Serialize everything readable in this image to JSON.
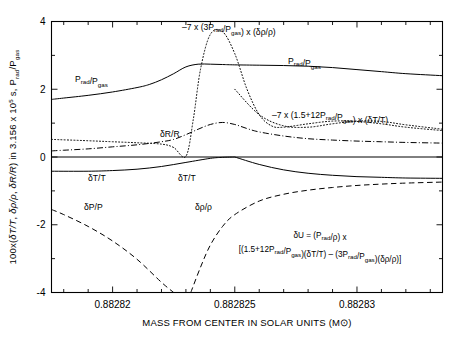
{
  "chart_data": {
    "type": "line",
    "title": "",
    "xlabel": "MASS FROM CENTER IN SOLAR UNITS (M⊙)",
    "ylabel": "100x(δT/T, δρ/ρ, δR/R) in 3.156 x 10⁵ s, P_rad/P_gas",
    "xlim": [
      0.8828175,
      0.8828335
    ],
    "ylim": [
      -4,
      4
    ],
    "grid": false,
    "legend_position": "inline-curve-labels",
    "xticks": [
      "0.88282",
      "0.882825",
      "0.88283"
    ],
    "xtick_values": [
      0.88282,
      0.882825,
      0.88283
    ],
    "yticks": [
      "4",
      "2",
      "0",
      "-2",
      "-4"
    ],
    "ytick_values": [
      4,
      2,
      0,
      -2,
      -4
    ],
    "minor_tick_step_y": 1,
    "minor_tick_step_x": 1e-06,
    "series": [
      {
        "name": "P_rad/P_gas",
        "label": "P_rad/P_gas",
        "style": "solid",
        "x": [
          0.8828175,
          0.882818,
          0.882819,
          0.88282,
          0.882821,
          0.8828215,
          0.882822,
          0.8828225,
          0.882823,
          0.8828235,
          0.882824,
          0.8828245,
          0.882825,
          0.882826,
          0.882827,
          0.882828,
          0.882829,
          0.88283,
          0.882831,
          0.882832,
          0.8828335
        ],
        "y": [
          1.7,
          1.74,
          1.82,
          1.92,
          2.05,
          2.14,
          2.28,
          2.46,
          2.66,
          2.74,
          2.74,
          2.73,
          2.72,
          2.71,
          2.7,
          2.68,
          2.64,
          2.58,
          2.52,
          2.46,
          2.4
        ]
      },
      {
        "name": "-7 x (3P_rad/P_gas) x (delta-rho/rho)",
        "label": "–7 x (3P_rad/P_gas) x (δρ/ρ)",
        "style": "dotted",
        "x": [
          0.8828175,
          0.882819,
          0.88282,
          0.882821,
          0.882822,
          0.8828225,
          0.882823,
          0.8828233,
          0.8828236,
          0.882824,
          0.8828245,
          0.882825,
          0.8828255,
          0.882826,
          0.8828265,
          0.882827,
          0.882828,
          0.882829,
          0.88283,
          0.882831,
          0.882832,
          0.8828335
        ],
        "y": [
          0.52,
          0.48,
          0.45,
          0.42,
          0.38,
          0.28,
          0.02,
          1.1,
          2.6,
          3.62,
          3.7,
          3.05,
          2.0,
          1.25,
          0.92,
          0.88,
          0.98,
          1.06,
          1.05,
          0.98,
          0.88,
          0.78
        ]
      },
      {
        "name": "-7 x (1.5+12P_rad/P_gas) x (delta-T/T)",
        "label": "–7 x (1.5+12P_rad/P_gas) x (δT/T)",
        "style": "dotted-right-branch",
        "x": [
          0.882825,
          0.882826,
          0.882827,
          0.882828,
          0.882829,
          0.88283,
          0.882831,
          0.882832,
          0.8828335
        ],
        "y": [
          2.0,
          1.25,
          0.92,
          0.88,
          0.98,
          1.06,
          1.05,
          0.95,
          0.82
        ]
      },
      {
        "name": "delta-R/R",
        "label": "δR/R",
        "style": "dash-dot",
        "x": [
          0.8828175,
          0.882818,
          0.882819,
          0.88282,
          0.882821,
          0.882822,
          0.8828225,
          0.882823,
          0.8828235,
          0.882824,
          0.8828245,
          0.882825,
          0.8828255,
          0.882826,
          0.882827,
          0.882828,
          0.882829,
          0.88283,
          0.882831,
          0.882832,
          0.8828335
        ],
        "y": [
          0.18,
          0.2,
          0.24,
          0.3,
          0.36,
          0.45,
          0.52,
          0.66,
          0.82,
          0.96,
          1.02,
          0.96,
          0.84,
          0.74,
          0.62,
          0.54,
          0.5,
          0.47,
          0.45,
          0.43,
          0.41
        ]
      },
      {
        "name": "delta-T/T-left",
        "label": "δT/T",
        "style": "solid",
        "x": [
          0.8828175,
          0.882819,
          0.88282,
          0.882821,
          0.882822,
          0.882823,
          0.882824,
          0.8828245,
          0.882825
        ],
        "y": [
          -0.42,
          -0.42,
          -0.4,
          -0.36,
          -0.28,
          -0.16,
          -0.04,
          -0.01,
          0.0
        ]
      },
      {
        "name": "delta-T/T-right",
        "label": "δT/T",
        "style": "solid",
        "x": [
          0.882825,
          0.882826,
          0.882827,
          0.882828,
          0.882829,
          0.88283,
          0.882831,
          0.882832,
          0.8828335
        ],
        "y": [
          0.0,
          -0.22,
          -0.38,
          -0.48,
          -0.54,
          -0.58,
          -0.6,
          -0.62,
          -0.63
        ]
      },
      {
        "name": "zero-line",
        "label": "",
        "style": "solid-flat",
        "x": [
          0.8828175,
          0.8828335
        ],
        "y": [
          0.0,
          0.0
        ]
      },
      {
        "name": "delta-P/P",
        "label": "δP/P",
        "style": "dashed",
        "x": [
          0.8828175,
          0.882818,
          0.882819,
          0.88282,
          0.882821,
          0.882822,
          0.8828225
        ],
        "y": [
          -1.55,
          -1.7,
          -2.05,
          -2.48,
          -3.02,
          -3.7,
          -4.0
        ]
      },
      {
        "name": "delta-rho/rho",
        "label": "δρ/ρ",
        "style": "dashed",
        "x": [
          0.8828232,
          0.8828236,
          0.882824,
          0.8828245,
          0.882825,
          0.882826,
          0.882827,
          0.882828,
          0.882829,
          0.88283,
          0.882831,
          0.882832,
          0.8828335
        ],
        "y": [
          -4.0,
          -3.25,
          -2.6,
          -2.05,
          -1.7,
          -1.3,
          -1.1,
          -0.98,
          -0.9,
          -0.84,
          -0.8,
          -0.77,
          -0.74
        ]
      }
    ],
    "annotations": [
      {
        "name": "label-prad-pgas-left",
        "text": "P_rad/P_gas",
        "x_px": 75,
        "y_px": 82
      },
      {
        "name": "label-prad-pgas-right",
        "text": "P_rad/P_gas",
        "x_px": 288,
        "y_px": 64
      },
      {
        "name": "label-7x3prad",
        "text": "–7 x (3P_rad/P_gas) x (δρ/ρ)",
        "x_px": 182,
        "y_px": 30
      },
      {
        "name": "label-7x15plus12prad",
        "text": "–7 x (1.5+12P_rad/P_gas) x (δT/T)",
        "x_px": 272,
        "y_px": 118
      },
      {
        "name": "label-deltaR-R",
        "text": "δR/R",
        "x_px": 160,
        "y_px": 137
      },
      {
        "name": "label-deltaT-T-left",
        "text": "δT/T",
        "x_px": 88,
        "y_px": 181
      },
      {
        "name": "label-deltaT-T-right",
        "text": "δT/T",
        "x_px": 178,
        "y_px": 181
      },
      {
        "name": "label-deltaP-P",
        "text": "δP/P",
        "x_px": 84,
        "y_px": 210
      },
      {
        "name": "label-deltarho-rho",
        "text": "δρ/ρ",
        "x_px": 195,
        "y_px": 210
      },
      {
        "name": "formula-line1",
        "text": "δU = (P_rad/ρ) x",
        "x_px": 320,
        "y_px": 238
      },
      {
        "name": "formula-line2",
        "text": "[(1.5+12P_rad/P_gas)(δT/T) – (3P_rad/P_gas)(δρ/ρ)]",
        "x_px": 320,
        "y_px": 252
      }
    ]
  },
  "axis": {
    "x_title": "MASS FROM CENTER IN SOLAR UNITS (M⊙)",
    "x_ticks": [
      "0.88282",
      "0.882825",
      "0.88283"
    ],
    "y_ticks": [
      "4",
      "2",
      "0",
      "-2",
      "-4"
    ],
    "y_title_parts": {
      "p1": "100x(",
      "dT": "δT/T",
      "sep1": ", ",
      "drho": "δρ/ρ",
      "sep2": ", ",
      "dR": "δR/R",
      "p2": ") in 3.156 x 10",
      "exp": "5",
      "p3": " s, P",
      "sub1": "rad",
      "p4": "/P",
      "sub2": "gas"
    }
  },
  "colors": {
    "ink": "#000000",
    "background": "#ffffff"
  }
}
